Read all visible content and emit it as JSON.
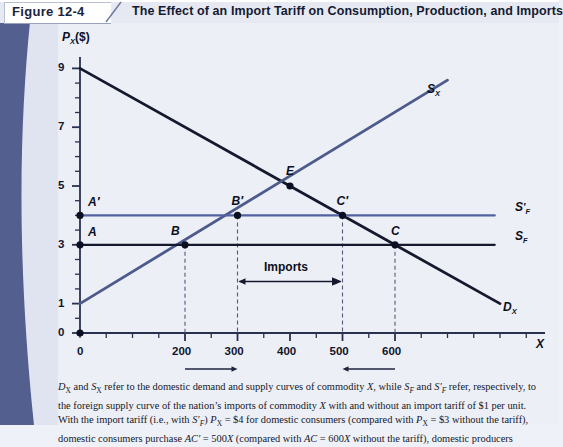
{
  "header": {
    "figure_number": "Figure 12-4",
    "title": "The Effect of an Import Tariff on Consumption, Production, and Imports"
  },
  "chart_data": {
    "type": "line",
    "title": "The Effect of an Import Tariff on Consumption, Production, and Imports",
    "xlabel": "X",
    "ylabel": "P_X($)",
    "ylabel_display": "P",
    "ylabel_sub": "X",
    "ylabel_unit": "($)",
    "xlim": [
      0,
      900
    ],
    "ylim": [
      0,
      9.6
    ],
    "grid": false,
    "legend_position": "inline-right",
    "y_major_ticks": [
      0,
      1,
      3,
      5,
      7,
      9
    ],
    "y_major_tick_labels": [
      "0",
      "1",
      "3",
      "5",
      "7",
      "9"
    ],
    "y_minor_tick_step": 1,
    "x_major_ticks": [
      200,
      300,
      400,
      500,
      600
    ],
    "x_major_tick_labels": [
      "200",
      "300",
      "400",
      "500",
      "600"
    ],
    "x_origin_label": "0",
    "x_minor_tick_step": 50,
    "series": [
      {
        "name": "D_X",
        "label": "D",
        "label_sub": "X",
        "type": "line",
        "color": "#15192e",
        "points": [
          [
            0,
            9
          ],
          [
            800,
            1
          ]
        ],
        "description": "domestic demand curve of commodity X"
      },
      {
        "name": "S_X",
        "label": "S",
        "label_sub": "X",
        "type": "line",
        "color": "#4d5a8c",
        "points": [
          [
            0,
            1
          ],
          [
            700,
            8.6
          ]
        ],
        "description": "domestic supply curve of commodity X"
      },
      {
        "name": "S_F",
        "label": "S",
        "label_sub": "F",
        "type": "horizontal",
        "color": "#15192e",
        "value": 3,
        "points": [
          [
            0,
            3
          ],
          [
            790,
            3
          ]
        ],
        "description": "foreign supply curve without import tariff"
      },
      {
        "name": "S_F_prime",
        "label": "S",
        "label_sub": "F",
        "label_prime": "′",
        "type": "horizontal",
        "color": "#5361a0",
        "value": 4,
        "points": [
          [
            0,
            4
          ],
          [
            790,
            4
          ]
        ],
        "description": "foreign supply curve with import tariff of $1 per unit"
      }
    ],
    "points": [
      {
        "name": "A-prime",
        "label": "A′",
        "x": 0,
        "y": 4
      },
      {
        "name": "A",
        "label": "A",
        "x": 0,
        "y": 3
      },
      {
        "name": "B-prime",
        "label": "B′",
        "x": 300,
        "y": 4
      },
      {
        "name": "B",
        "label": "B",
        "x": 200,
        "y": 3
      },
      {
        "name": "E",
        "label": "E",
        "x": 400,
        "y": 5
      },
      {
        "name": "C-prime",
        "label": "C′",
        "x": 500,
        "y": 4
      },
      {
        "name": "C",
        "label": "C",
        "x": 600,
        "y": 3
      },
      {
        "name": "origin",
        "label": "",
        "x": 0,
        "y": 0
      }
    ],
    "dashed_droplines": [
      {
        "x": 200,
        "from_y": 3,
        "to_y": 0
      },
      {
        "x": 300,
        "from_y": 4,
        "to_y": 0
      },
      {
        "x": 500,
        "from_y": 4,
        "to_y": 0
      },
      {
        "x": 600,
        "from_y": 3,
        "to_y": 0
      }
    ],
    "annotations": [
      {
        "name": "imports-span",
        "text": "Imports",
        "x_from": 300,
        "x_to": 500,
        "y": 1.75
      },
      {
        "name": "production-expansion-arrow",
        "text": "",
        "x_from": 200,
        "x_to": 300,
        "direction": "right"
      },
      {
        "name": "consumption-contraction-arrow",
        "text": "",
        "x_from": 600,
        "x_to": 500,
        "direction": "left"
      }
    ]
  },
  "caption": {
    "line1": "Dₓ and Sₓ refer to the domestic demand and supply curves of commodity X, while Sғ and S′ғ refer, respectively, to",
    "line2": "the foreign supply curve of the nation's imports of commodity X with and without an import tariff of $1 per unit.",
    "line3": "With the import tariff (i.e., with S′ғ) Pₓ = $4 for domestic consumers (compared with Pₓ = $3 without the tariff),",
    "line4": "domestic consumers purchase AC′ = 500X (compared with AC = 600X without the tariff), domestic producers"
  },
  "colors": {
    "page_background": "#eceff6",
    "band_dark": "#525f8f",
    "band_light": "#dfe4f0",
    "domestic_curve": "#15192e",
    "supply_curve": "#4d5a8c",
    "foreign_supply": "#15192e",
    "foreign_supply_tariff": "#5361a0",
    "text": "#15182b"
  }
}
